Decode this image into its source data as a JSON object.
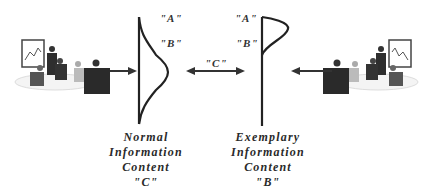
{
  "diagram": {
    "left_curve": {
      "labels": [
        "\"A\"",
        "\"B\""
      ],
      "caption": [
        "Normal",
        "Information",
        "Content",
        "\"C\""
      ]
    },
    "right_curve": {
      "labels": [
        "\"A\"",
        "\"B\""
      ],
      "caption": [
        "Exemplary",
        "Information",
        "Content",
        "\"B\""
      ]
    },
    "middle_label": "\"C\"",
    "left_image": "business-meeting-clipart",
    "right_image": "business-meeting-clipart-mirrored"
  }
}
